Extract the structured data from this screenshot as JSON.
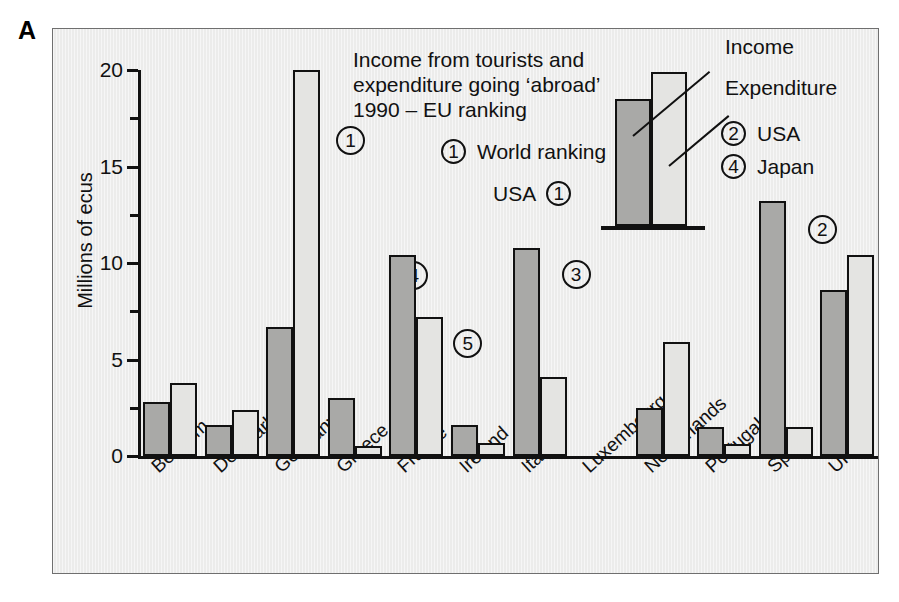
{
  "panel": {
    "letter": "A"
  },
  "chart_data": {
    "type": "bar",
    "title_lines": [
      "Income from tourists and",
      "expenditure going ‘abroad’",
      "1990 – EU ranking"
    ],
    "xlabel": "",
    "ylabel": "Millions of ecus",
    "ylim": [
      0,
      20
    ],
    "yticks": [
      0,
      5,
      10,
      15,
      20
    ],
    "ytick_labels": [
      "0",
      "5",
      "10",
      "15",
      "20"
    ],
    "yminor_ticks": [
      2.5,
      7.5,
      12.5,
      17.5
    ],
    "grid": false,
    "legend_position": "top-right-inset",
    "categories": [
      "Belgium",
      "Denmark",
      "Germany",
      "Greece",
      "France",
      "Ireland",
      "Italy",
      "Luxembourg",
      "Netherlands",
      "Portugal",
      "Spain",
      "UK"
    ],
    "series": [
      {
        "name": "Income",
        "color": "#a9a9a7",
        "values": [
          2.8,
          1.6,
          6.7,
          3.0,
          10.4,
          1.6,
          10.8,
          0.0,
          2.5,
          1.5,
          13.2,
          8.6
        ]
      },
      {
        "name": "Expenditure",
        "color": "#e4e4e2",
        "values": [
          3.8,
          2.4,
          20.0,
          0.5,
          7.2,
          0.7,
          4.1,
          0.0,
          5.9,
          0.6,
          1.5,
          10.4
        ]
      }
    ],
    "annotations": [
      {
        "label": "1",
        "category": "Germany",
        "series": "Expenditure",
        "note": "World ranking"
      },
      {
        "label": "4",
        "category": "France",
        "series": "Income",
        "note": "World ranking"
      },
      {
        "label": "5",
        "category": "France",
        "series": "Expenditure",
        "note": "World ranking"
      },
      {
        "label": "3",
        "category": "Italy",
        "series": "Income",
        "note": "World ranking"
      },
      {
        "label": "2",
        "category": "Spain",
        "series": "Income",
        "note": "World ranking"
      },
      {
        "label": "5",
        "category": "UK",
        "series": "Income",
        "note": "World ranking"
      },
      {
        "label": "3",
        "category": "UK",
        "series": "Expenditure",
        "note": "World ranking"
      }
    ]
  },
  "keys": {
    "world_ranking_symbol": "1",
    "world_ranking_label": "World ranking",
    "usa_left_label": "USA",
    "usa_left_symbol": "1",
    "legend_income": "Income",
    "legend_expenditure": "Expenditure",
    "right_rows": [
      {
        "symbol": "2",
        "label": "USA"
      },
      {
        "symbol": "4",
        "label": "Japan"
      }
    ]
  },
  "colors": {
    "income_fill": "#a9a9a7",
    "expenditure_fill": "#e4e4e2",
    "outline": "#111111",
    "panel_background": "#ececeb"
  }
}
